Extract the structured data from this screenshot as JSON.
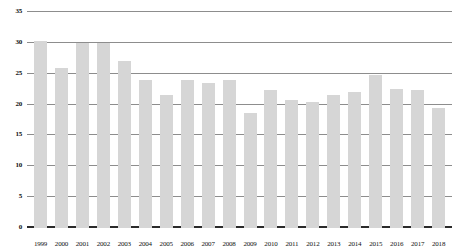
{
  "chart_data": {
    "type": "bar",
    "title": "",
    "subtitle": "",
    "xlabel": "",
    "ylabel": "",
    "categories": [
      "1999",
      "2000",
      "2001",
      "2002",
      "2003",
      "2004",
      "2005",
      "2006",
      "2007",
      "2008",
      "2009",
      "2010",
      "2011",
      "2012",
      "2013",
      "2014",
      "2015",
      "2016",
      "2017",
      "2018"
    ],
    "values": [
      30.3,
      26.0,
      30.0,
      30.0,
      27.0,
      24.0,
      21.5,
      24.0,
      23.5,
      24.0,
      18.7,
      22.3,
      20.8,
      20.5,
      21.5,
      22.0,
      24.8,
      22.5,
      22.4,
      19.5
    ],
    "series": [
      {
        "name": "",
        "values": [
          30.3,
          26.0,
          30.0,
          30.0,
          27.0,
          24.0,
          21.5,
          24.0,
          23.5,
          24.0,
          18.7,
          22.3,
          20.8,
          20.5,
          21.5,
          22.0,
          24.8,
          22.5,
          22.4,
          19.5
        ]
      }
    ],
    "ylim": [
      0,
      35
    ],
    "ytick_values": [
      0,
      5,
      10,
      15,
      20,
      25,
      30,
      35
    ],
    "ytick_labels": [
      "0",
      "5",
      "10",
      "15",
      "20",
      "25",
      "30",
      "35"
    ],
    "grid": true,
    "legend": false,
    "legend_position": "none",
    "annotations": []
  },
  "style": {
    "bar_color": "#d6d6d6",
    "gridline_color": "#8d8d8d",
    "baseline_color": "#2b2b2b",
    "background_color": "#ffffff",
    "text_color": "#111111"
  }
}
